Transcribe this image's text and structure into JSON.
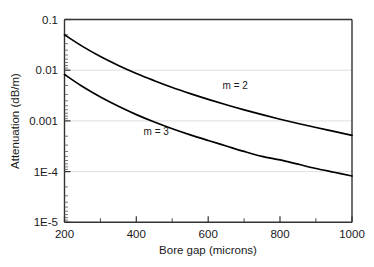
{
  "chart_data": {
    "type": "line",
    "title": "",
    "xlabel": "Bore gap (microns)",
    "ylabel": "Attenuation (dB/m)",
    "xscale": "linear",
    "yscale": "log",
    "xlim": [
      200,
      1000
    ],
    "ylim": [
      1e-05,
      0.1
    ],
    "grid": true,
    "grid_axis": "y",
    "legend_position": "inline-annotations",
    "x_ticks_major": [
      200,
      400,
      600,
      800,
      1000
    ],
    "x_ticks_minor": [
      300,
      500,
      700,
      900
    ],
    "x_tick_labels": [
      "200",
      "400",
      "600",
      "800",
      "1000"
    ],
    "y_ticks_major": [
      0.1,
      0.01,
      0.001,
      0.0001,
      1e-05
    ],
    "y_tick_labels": [
      "0.1",
      "0.01",
      "0.001",
      "1E-4",
      "1E-5"
    ],
    "series": [
      {
        "name": "m = 2",
        "label": "m = 2",
        "color": "#000000",
        "x": [
          200,
          250,
          300,
          350,
          400,
          450,
          500,
          550,
          600,
          650,
          700,
          750,
          800,
          850,
          900,
          950,
          1000
        ],
        "y": [
          0.05,
          0.0295,
          0.0186,
          0.0124,
          0.0086,
          0.0062,
          0.00455,
          0.00345,
          0.00266,
          0.00208,
          0.00165,
          0.00133,
          0.00108,
          0.00089,
          0.00074,
          0.00062,
          0.00052
        ]
      },
      {
        "name": "m = 3",
        "label": "m = 3",
        "color": "#000000",
        "x": [
          200,
          250,
          300,
          350,
          400,
          450,
          500,
          550,
          600,
          650,
          700,
          750,
          800,
          850,
          900,
          950,
          1000
        ],
        "y": [
          0.0082,
          0.00475,
          0.00295,
          0.00194,
          0.00133,
          0.00095,
          0.0007,
          0.00053,
          0.00041,
          0.00032,
          0.00025,
          0.0002,
          0.00017,
          0.00014,
          0.000115,
          9.7e-05,
          8.2e-05
        ]
      }
    ],
    "annotations": [
      {
        "text": "m = 2",
        "x": 640,
        "y": 0.0042
      },
      {
        "text": "m = 3",
        "x": 420,
        "y": 0.00052
      }
    ],
    "colors": {
      "axis": "#333333",
      "grid": "#d8d8d8",
      "curve": "#000000",
      "text": "#1a1a1a",
      "background": "#ffffff"
    }
  }
}
